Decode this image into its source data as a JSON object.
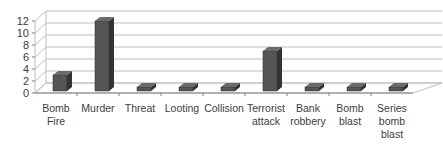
{
  "chart_data": {
    "type": "bar",
    "style": "3d-column",
    "title": "",
    "xlabel": "",
    "ylabel": "",
    "categories": [
      "Bomb Fire",
      "Murder",
      "Threat",
      "Looting",
      "Collision",
      "Terrorist attack",
      "Bank robbery",
      "Bomb blast",
      "Series bomb blast"
    ],
    "category_lines": [
      [
        "Bomb",
        "Fire"
      ],
      [
        "Murder"
      ],
      [
        "Threat"
      ],
      [
        "Looting"
      ],
      [
        "Collision"
      ],
      [
        "Terrorist",
        "attack"
      ],
      [
        "Bank",
        "robbery"
      ],
      [
        "Bomb",
        "blast"
      ],
      [
        "Series",
        "bomb",
        "blast"
      ]
    ],
    "values": [
      3,
      12,
      1,
      1,
      1,
      7,
      1,
      1,
      1
    ],
    "ylim": [
      0,
      12
    ],
    "yticks": [
      0,
      2,
      4,
      6,
      8,
      10,
      12
    ],
    "grid": true,
    "legend": null,
    "colors": {
      "bar_front": "#555555",
      "bar_side": "#333333",
      "bar_top": "#6a6a6a",
      "grid": "#bfbfbf",
      "text": "#404040"
    }
  }
}
